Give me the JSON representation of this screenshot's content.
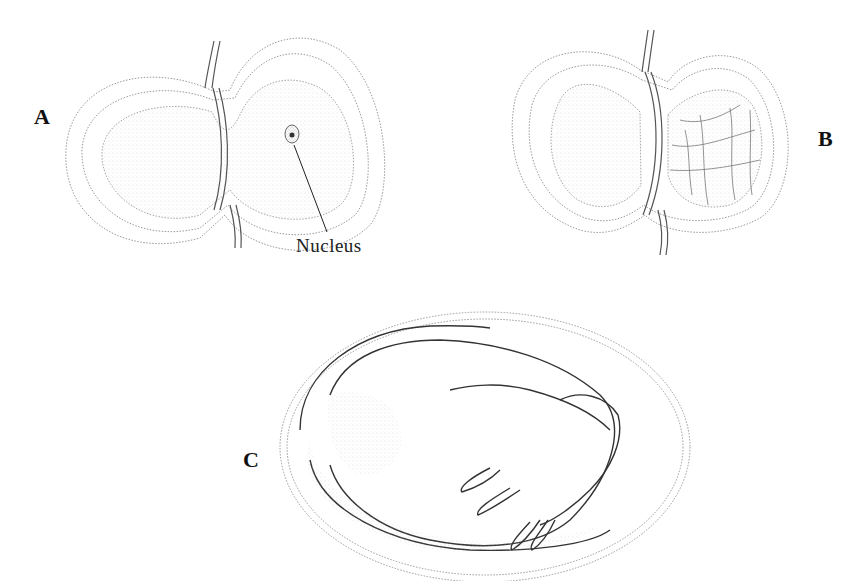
{
  "figure": {
    "panels": [
      {
        "id": "A",
        "label": "A",
        "description": "Two-lobed egg capsule; one cell with visible nucleus",
        "callouts": [
          {
            "text": "Nucleus"
          }
        ]
      },
      {
        "id": "B",
        "label": "B",
        "description": "Two-lobed egg capsule; one lobe showing cleavage into many cells"
      },
      {
        "id": "C",
        "label": "C",
        "description": "Oval capsule containing coiled developing embryo"
      }
    ]
  },
  "colors": {
    "ink": "#333333",
    "stipple": "#9a9a9a",
    "background": "#ffffff"
  }
}
